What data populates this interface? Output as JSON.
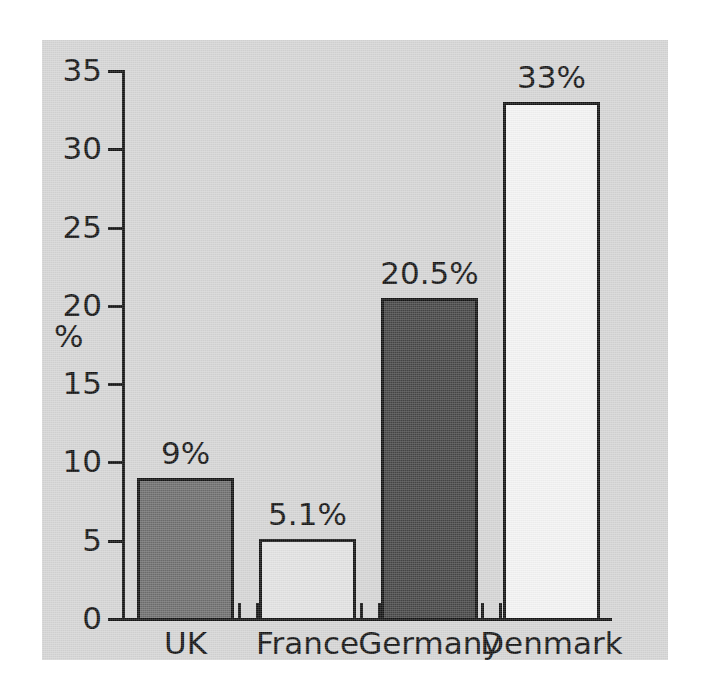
{
  "figure": {
    "background_color": "#ffffff",
    "panel_color": "#d5d5d5",
    "axis_color": "#141414"
  },
  "chart_data": {
    "type": "bar",
    "title": "",
    "subtitle": "",
    "xlabel": "",
    "ylabel": "%",
    "categories": [
      "UK",
      "France",
      "Germany",
      "Denmark"
    ],
    "values": [
      9,
      5.1,
      20.5,
      33
    ],
    "value_labels": [
      "9%",
      "5.1%",
      "20.5%",
      "33%"
    ],
    "bar_colors": [
      "#6e6e6e",
      "#e2e2e2",
      "#464646",
      "#f3f3f3"
    ],
    "bar_edge_color": "#141414",
    "ylim": [
      0,
      35
    ],
    "xlim_note": "categorical",
    "yticks": [
      0,
      5,
      10,
      15,
      20,
      25,
      30,
      35
    ],
    "ytick_labels": [
      "0",
      "5",
      "10",
      "15",
      "20",
      "25",
      "30",
      "35"
    ],
    "grid": false,
    "legend": null,
    "legend_position": "none",
    "annotations": []
  }
}
